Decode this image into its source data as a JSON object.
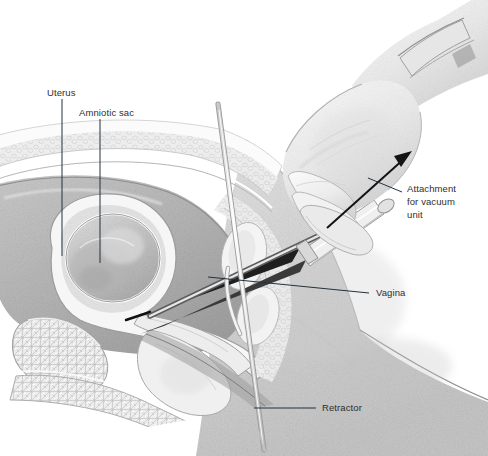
{
  "figure": {
    "width": 488,
    "height": 456,
    "background_color": "#ffffff",
    "style": "grayscale pencil / stipple medical illustration"
  },
  "labels": {
    "uterus": "Uterus",
    "amniotic_sac": "Amniotic sac",
    "attachment": "Attachment\nfor vacuum\nunit",
    "vagina": "Vagina",
    "retractor": "Retractor"
  },
  "label_positions": {
    "uterus": {
      "x": 47,
      "y": 86
    },
    "amniotic_sac": {
      "x": 79,
      "y": 106
    },
    "attachment": {
      "x": 407,
      "y": 182
    },
    "vagina": {
      "x": 376,
      "y": 286
    },
    "retractor": {
      "x": 322,
      "y": 401
    }
  },
  "leader_lines": [
    {
      "name": "uterus-leader",
      "orientation": "vertical",
      "x": 62,
      "y1": 99,
      "y2": 256
    },
    {
      "name": "amniotic-sac-leader",
      "orientation": "vertical",
      "x": 100,
      "y1": 119,
      "y2": 263
    },
    {
      "name": "attachment-leader",
      "orientation": "diagonal",
      "x1": 368,
      "y1": 178,
      "x2": 402,
      "y2": 192
    },
    {
      "name": "vagina-leader",
      "orientation": "diagonal",
      "x1": 208,
      "y1": 277,
      "x2": 369,
      "y2": 293
    },
    {
      "name": "retractor-leader",
      "orientation": "horizontal",
      "x1": 254,
      "y1": 408,
      "x2": 316,
      "y2": 408
    }
  ],
  "annotations": {
    "direction_arrow": {
      "name": "vacuum-direction-arrow",
      "description": "arrow along cannula pointing up-right toward vacuum unit",
      "x1": 327,
      "y1": 228,
      "x2": 412,
      "y2": 152,
      "color": "#141414"
    }
  },
  "anatomy": [
    {
      "name": "abdominal-wall",
      "description": "anterior abdominal wall with subcutaneous fat layer"
    },
    {
      "name": "uterus-body",
      "description": "gravid uterus, pear shaped, shaded mid-gray"
    },
    {
      "name": "amniotic-sac",
      "description": "amniotic sac inside uterine cavity"
    },
    {
      "name": "cervix",
      "description": "cervical canal with cannula passing through"
    },
    {
      "name": "vaginal-canal",
      "description": "vaginal canal held open by retractor"
    },
    {
      "name": "pubic-bone",
      "description": "pubic symphysis with trabecular bone texture"
    },
    {
      "name": "sacrum",
      "description": "sacral bone posterior"
    },
    {
      "name": "bladder",
      "description": "urinary bladder anterior to uterus"
    },
    {
      "name": "thigh",
      "description": "patient thigh, large light-gray stippled mass at right"
    }
  ],
  "instruments": [
    {
      "name": "cannula",
      "description": "aspiration cannula inserted through cervix into uterus"
    },
    {
      "name": "retractor",
      "description": "long thin vaginal retractor"
    },
    {
      "name": "gloved-hand",
      "description": "clinician gloved hand gripping cannula handle"
    },
    {
      "name": "glove-cuff",
      "description": "glove cuff band at wrist"
    }
  ],
  "colors": {
    "background": "#ffffff",
    "label_text": "#2e2e2e",
    "leader_line": "#23323c",
    "arrow": "#141414",
    "tissue_light": "#ededed",
    "tissue_mid": "#d2d2d2",
    "tissue_dark": "#a9a9a9",
    "instrument_dark": "#2b2b2b"
  }
}
